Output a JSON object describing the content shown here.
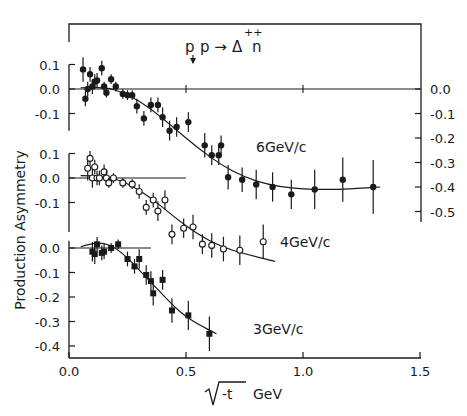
{
  "chart_data": {
    "type": "scatter",
    "xlabel": "√-t GeV",
    "ylabel": "Production Asymmetry",
    "xlim": [
      0.0,
      1.5
    ],
    "x_ticks": [
      "0.0",
      "0.5",
      "1.0",
      "1.5"
    ],
    "grid": false,
    "legend": "inline labels next to each curve",
    "panels": [
      {
        "name": "6GeV/c",
        "label": "6GeV/c",
        "marker": "filled-circle",
        "y_ticks_left": [
          "0.1",
          "0.0",
          "-0.1"
        ],
        "y_ticks_right": [
          "0.0",
          "-0.1",
          "-0.2",
          "-0.3",
          "-0.4",
          "-0.5"
        ],
        "ylim": [
          -0.5,
          0.1
        ],
        "points": [
          {
            "x": 0.06,
            "y": 0.08,
            "err": 0.05
          },
          {
            "x": 0.07,
            "y": -0.04,
            "err": 0.03
          },
          {
            "x": 0.08,
            "y": 0.0,
            "err": 0.03
          },
          {
            "x": 0.09,
            "y": 0.06,
            "err": 0.03
          },
          {
            "x": 0.1,
            "y": 0.01,
            "err": 0.03
          },
          {
            "x": 0.11,
            "y": 0.03,
            "err": 0.03
          },
          {
            "x": 0.12,
            "y": 0.035,
            "err": 0.03
          },
          {
            "x": 0.14,
            "y": 0.085,
            "err": 0.03
          },
          {
            "x": 0.15,
            "y": 0.01,
            "err": 0.02
          },
          {
            "x": 0.16,
            "y": -0.015,
            "err": 0.02
          },
          {
            "x": 0.18,
            "y": 0.04,
            "err": 0.02
          },
          {
            "x": 0.2,
            "y": 0.01,
            "err": 0.02
          },
          {
            "x": 0.23,
            "y": -0.02,
            "err": 0.02
          },
          {
            "x": 0.25,
            "y": -0.025,
            "err": 0.02
          },
          {
            "x": 0.27,
            "y": -0.025,
            "err": 0.02
          },
          {
            "x": 0.29,
            "y": -0.07,
            "err": 0.03
          },
          {
            "x": 0.32,
            "y": -0.12,
            "err": 0.03
          },
          {
            "x": 0.35,
            "y": -0.065,
            "err": 0.03
          },
          {
            "x": 0.38,
            "y": -0.065,
            "err": 0.03
          },
          {
            "x": 0.4,
            "y": -0.115,
            "err": 0.04
          },
          {
            "x": 0.43,
            "y": -0.17,
            "err": 0.04
          },
          {
            "x": 0.46,
            "y": -0.155,
            "err": 0.04
          },
          {
            "x": 0.51,
            "y": -0.135,
            "err": 0.04
          },
          {
            "x": 0.58,
            "y": -0.23,
            "err": 0.05
          },
          {
            "x": 0.61,
            "y": -0.27,
            "err": 0.04
          },
          {
            "x": 0.64,
            "y": -0.27,
            "err": 0.04
          },
          {
            "x": 0.65,
            "y": -0.23,
            "err": 0.04
          },
          {
            "x": 0.68,
            "y": -0.36,
            "err": 0.05
          },
          {
            "x": 0.74,
            "y": -0.37,
            "err": 0.05
          },
          {
            "x": 0.8,
            "y": -0.39,
            "err": 0.06
          },
          {
            "x": 0.87,
            "y": -0.4,
            "err": 0.06
          },
          {
            "x": 0.95,
            "y": -0.43,
            "err": 0.06
          },
          {
            "x": 1.05,
            "y": -0.41,
            "err": 0.08
          },
          {
            "x": 1.17,
            "y": -0.37,
            "err": 0.09
          },
          {
            "x": 1.3,
            "y": -0.4,
            "err": 0.11
          }
        ],
        "curve": [
          [
            0.05,
            0.005
          ],
          [
            0.15,
            0.01
          ],
          [
            0.25,
            -0.02
          ],
          [
            0.35,
            -0.08
          ],
          [
            0.45,
            -0.16
          ],
          [
            0.55,
            -0.24
          ],
          [
            0.65,
            -0.31
          ],
          [
            0.75,
            -0.36
          ],
          [
            0.85,
            -0.39
          ],
          [
            0.95,
            -0.405
          ],
          [
            1.05,
            -0.41
          ],
          [
            1.15,
            -0.41
          ],
          [
            1.25,
            -0.405
          ],
          [
            1.33,
            -0.4
          ]
        ],
        "zero_line": [
          0.0,
          1.5
        ]
      },
      {
        "name": "4GeV/c",
        "label": "4GeV/c",
        "marker": "open-circle",
        "y_ticks_left": [
          "0.1",
          "0.0",
          "-0.1"
        ],
        "ylim": [
          -0.2,
          0.1
        ],
        "points": [
          {
            "x": 0.08,
            "y": 0.04,
            "err": 0.05
          },
          {
            "x": 0.09,
            "y": 0.08,
            "err": 0.03
          },
          {
            "x": 0.1,
            "y": 0.0,
            "err": 0.04
          },
          {
            "x": 0.11,
            "y": 0.045,
            "err": 0.03
          },
          {
            "x": 0.12,
            "y": 0.0,
            "err": 0.03
          },
          {
            "x": 0.13,
            "y": 0.0,
            "err": 0.03
          },
          {
            "x": 0.15,
            "y": 0.025,
            "err": 0.03
          },
          {
            "x": 0.16,
            "y": 0.0,
            "err": 0.03
          },
          {
            "x": 0.17,
            "y": -0.02,
            "err": 0.02
          },
          {
            "x": 0.19,
            "y": 0.0,
            "err": 0.02
          },
          {
            "x": 0.23,
            "y": -0.02,
            "err": 0.02
          },
          {
            "x": 0.27,
            "y": -0.025,
            "err": 0.02
          },
          {
            "x": 0.3,
            "y": -0.055,
            "err": 0.03
          },
          {
            "x": 0.33,
            "y": -0.12,
            "err": 0.03
          },
          {
            "x": 0.36,
            "y": -0.09,
            "err": 0.03
          },
          {
            "x": 0.38,
            "y": -0.135,
            "err": 0.04
          },
          {
            "x": 0.41,
            "y": -0.09,
            "err": 0.04
          },
          {
            "x": 0.44,
            "y": -0.23,
            "err": 0.04
          },
          {
            "x": 0.49,
            "y": -0.205,
            "err": 0.04
          },
          {
            "x": 0.53,
            "y": -0.2,
            "err": 0.05
          },
          {
            "x": 0.57,
            "y": -0.27,
            "err": 0.04
          },
          {
            "x": 0.61,
            "y": -0.275,
            "err": 0.05
          },
          {
            "x": 0.66,
            "y": -0.29,
            "err": 0.05
          },
          {
            "x": 0.73,
            "y": -0.295,
            "err": 0.06
          },
          {
            "x": 0.83,
            "y": -0.26,
            "err": 0.07
          }
        ],
        "curve": [
          [
            0.05,
            0.01
          ],
          [
            0.15,
            0.01
          ],
          [
            0.25,
            -0.02
          ],
          [
            0.35,
            -0.08
          ],
          [
            0.45,
            -0.16
          ],
          [
            0.55,
            -0.23
          ],
          [
            0.65,
            -0.28
          ],
          [
            0.75,
            -0.31
          ],
          [
            0.88,
            -0.34
          ]
        ],
        "zero_line": [
          0.0,
          0.5
        ]
      },
      {
        "name": "3GeV/c",
        "label": "3GeV/c",
        "marker": "filled-square",
        "y_ticks_left": [
          "0.0",
          "-0.1",
          "-0.2",
          "-0.3",
          "-0.4"
        ],
        "ylim": [
          -0.4,
          0.0
        ],
        "points": [
          {
            "x": 0.1,
            "y": -0.015,
            "err": 0.04
          },
          {
            "x": 0.11,
            "y": -0.025,
            "err": 0.04
          },
          {
            "x": 0.12,
            "y": 0.015,
            "err": 0.03
          },
          {
            "x": 0.14,
            "y": -0.02,
            "err": 0.03
          },
          {
            "x": 0.15,
            "y": -0.015,
            "err": 0.03
          },
          {
            "x": 0.18,
            "y": 0.0,
            "err": 0.02
          },
          {
            "x": 0.21,
            "y": 0.015,
            "err": 0.02
          },
          {
            "x": 0.25,
            "y": -0.045,
            "err": 0.03
          },
          {
            "x": 0.28,
            "y": -0.075,
            "err": 0.03
          },
          {
            "x": 0.3,
            "y": -0.045,
            "err": 0.04
          },
          {
            "x": 0.33,
            "y": -0.11,
            "err": 0.04
          },
          {
            "x": 0.35,
            "y": -0.135,
            "err": 0.04
          },
          {
            "x": 0.36,
            "y": -0.185,
            "err": 0.05
          },
          {
            "x": 0.4,
            "y": -0.13,
            "err": 0.04
          },
          {
            "x": 0.44,
            "y": -0.255,
            "err": 0.05
          },
          {
            "x": 0.51,
            "y": -0.275,
            "err": 0.06
          },
          {
            "x": 0.6,
            "y": -0.35,
            "err": 0.07
          }
        ],
        "curve": [
          [
            0.05,
            0.005
          ],
          [
            0.1,
            0.02
          ],
          [
            0.15,
            0.02
          ],
          [
            0.2,
            0.0
          ],
          [
            0.25,
            -0.04
          ],
          [
            0.3,
            -0.09
          ],
          [
            0.35,
            -0.14
          ],
          [
            0.4,
            -0.19
          ],
          [
            0.45,
            -0.24
          ],
          [
            0.5,
            -0.28
          ],
          [
            0.55,
            -0.31
          ],
          [
            0.63,
            -0.35
          ]
        ],
        "zero_line": [
          0.0,
          0.35
        ]
      }
    ]
  },
  "labels": {
    "title": "p",
    "title_rest": "p →",
    "title_delta": "Δ",
    "title_sup": "++",
    "title_n": "n",
    "ylabel": "Production Asymmetry",
    "xlabel_sqrt": "√",
    "xlabel_t": "-t",
    "xlabel_unit": "GeV",
    "panel_6": "6GeV/c",
    "panel_4": "4GeV/c",
    "panel_3": "3GeV/c",
    "x_ticks": [
      "0.0",
      "0.5",
      "1.0",
      "1.5"
    ],
    "left_ticks_6": [
      "0.1",
      "0.0",
      "-0.1"
    ],
    "left_ticks_4": [
      "0.1",
      "0.0",
      "-0.1"
    ],
    "left_ticks_3": [
      "0.0",
      "-0.1",
      "-0.2",
      "-0.3",
      "-0.4"
    ],
    "right_ticks": [
      "0.0",
      "-0.1",
      "-0.2",
      "-0.3",
      "-0.4",
      "-0.5"
    ]
  }
}
